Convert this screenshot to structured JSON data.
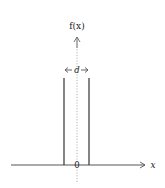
{
  "diagram": {
    "y_axis_label": "f(x)",
    "x_axis_label": "x",
    "origin_label": "0",
    "width_label": "d",
    "colors": {
      "line": "#333333",
      "dotted_axis": "#999999",
      "background": "#ffffff"
    }
  }
}
